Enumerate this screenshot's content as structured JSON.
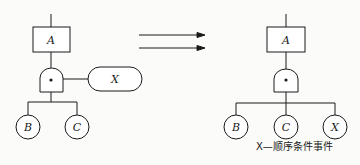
{
  "left_tree": {
    "top_event": "A",
    "gate": "priority-and-gate",
    "condition_event": "X",
    "inputs": [
      "B",
      "C"
    ]
  },
  "transform_arrow": "double-arrow-right",
  "right_tree": {
    "top_event": "A",
    "gate": "and-gate",
    "inputs": [
      "B",
      "C",
      "X"
    ]
  },
  "caption": "X—顺序条件事件",
  "colors": {
    "stroke": "#1a1a1a",
    "background": "#fbfbf9"
  }
}
